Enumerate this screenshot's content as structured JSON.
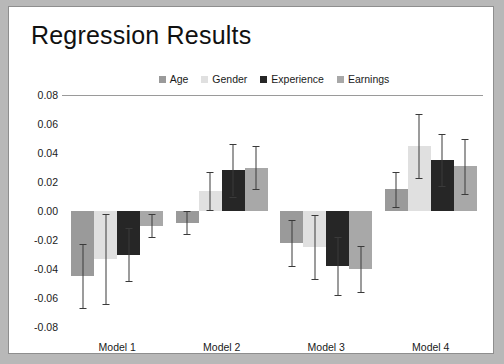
{
  "chart_data": {
    "type": "bar",
    "title": "Regression Results",
    "xlabel": "",
    "ylabel": "",
    "categories": [
      "Model 1",
      "Model 2",
      "Model 3",
      "Model 4"
    ],
    "ylim": [
      -0.08,
      0.08
    ],
    "ytick_labels": [
      "0.08",
      "0.06",
      "0.04",
      "0.02",
      "0.00",
      "-0.02",
      "-0.04",
      "-0.06",
      "-0.08"
    ],
    "ytick_values": [
      0.08,
      0.06,
      0.04,
      0.02,
      0.0,
      -0.02,
      -0.04,
      -0.06,
      -0.08
    ],
    "grid": false,
    "legend_position": "top-center",
    "error_bars": true,
    "series": [
      {
        "name": "Age",
        "color": "#9a9a9a",
        "values": [
          -0.045,
          -0.008,
          -0.022,
          0.015
        ],
        "errors": [
          0.022,
          0.008,
          0.016,
          0.012
        ]
      },
      {
        "name": "Gender",
        "color": "#e0e0e0",
        "values": [
          -0.033,
          0.014,
          -0.025,
          0.045
        ],
        "errors": [
          0.031,
          0.013,
          0.022,
          0.022
        ]
      },
      {
        "name": "Experience",
        "color": "#262626",
        "values": [
          -0.03,
          0.028,
          -0.038,
          0.035
        ],
        "errors": [
          0.018,
          0.018,
          0.02,
          0.018
        ]
      },
      {
        "name": "Earnings",
        "color": "#a8a8a8",
        "values": [
          -0.01,
          0.03,
          -0.04,
          0.031
        ],
        "errors": [
          0.008,
          0.015,
          0.016,
          0.019
        ]
      }
    ]
  }
}
